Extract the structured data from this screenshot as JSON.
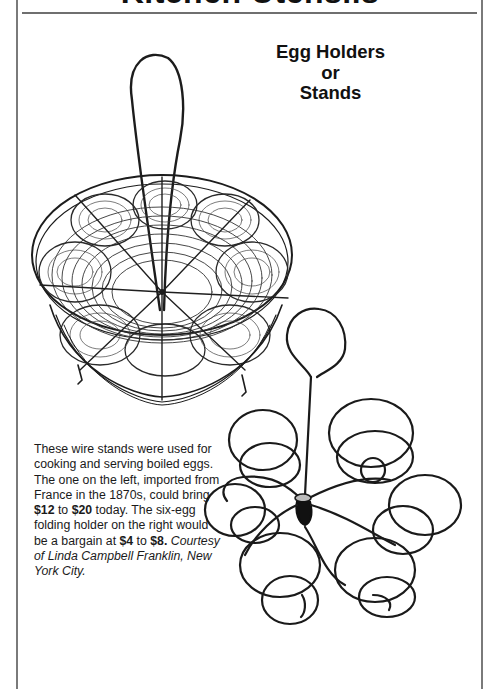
{
  "page": {
    "section_header": "Kitchen Utensils",
    "article_title": {
      "line1": "Egg Holders",
      "line2": "or",
      "line3": "Stands"
    },
    "caption": {
      "part1": "These wire stands were used for cooking and serving boiled eggs. The one on the left, imported from France in the 1870s, could bring ",
      "price_left_low": "$12",
      "to1": " to ",
      "price_left_high": "$20",
      "part2": " today. The six-egg folding holder on the right would be a bargain at ",
      "price_right_low": "$4",
      "to2": " to ",
      "price_right_high": "$8.",
      "credit": " Courtesy of Linda Campbell Franklin, New York City."
    },
    "illustrations": [
      {
        "name": "wire-egg-basket",
        "description": "round wire basket with central loop handle and circular egg rings"
      },
      {
        "name": "folding-egg-holder",
        "description": "six-egg folding spiral wire holder with loop handle"
      }
    ],
    "colors": {
      "ink": "#111111",
      "frame": "#7a7a7a",
      "background": "#ffffff"
    }
  }
}
